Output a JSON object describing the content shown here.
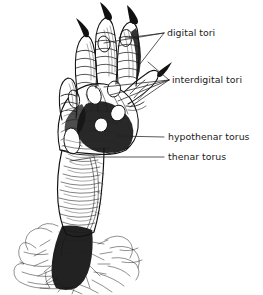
{
  "figure": {
    "background_color": "#ffffff",
    "ink_color": "#111111",
    "text_color": "#1a1a1a",
    "width": 263,
    "height": 295
  },
  "annotations": [
    {
      "id": "digital-tori",
      "label": "digital tori",
      "text_x": 167,
      "text_y": 36,
      "leader_count": 2,
      "pointer_origin": {
        "x": 164,
        "y": 33
      },
      "targets": [
        {
          "x": 104,
          "y": 43
        },
        {
          "x": 126,
          "y": 38
        }
      ]
    },
    {
      "id": "interdigital-tori",
      "label": "interdigital tori",
      "text_x": 172,
      "text_y": 83,
      "leader_count": 4,
      "pointer_origin": {
        "x": 169,
        "y": 80
      },
      "targets": [
        {
          "x": 104,
          "y": 87
        },
        {
          "x": 110,
          "y": 95
        },
        {
          "x": 118,
          "y": 101
        },
        {
          "x": 128,
          "y": 106
        }
      ]
    },
    {
      "id": "hypothenar-torus",
      "label": "hypothenar torus",
      "text_x": 168,
      "text_y": 140,
      "leader_count": 1,
      "pointer_origin": {
        "x": 164,
        "y": 137
      },
      "targets": [
        {
          "x": 116,
          "y": 137
        }
      ]
    },
    {
      "id": "thenar-torus",
      "label": "thenar torus",
      "text_x": 168,
      "text_y": 160,
      "leader_count": 1,
      "pointer_origin": {
        "x": 164,
        "y": 157
      },
      "targets": [
        {
          "x": 70,
          "y": 160
        }
      ]
    }
  ],
  "drawing_parts": [
    {
      "name": "digit-1-claw",
      "label": "claw of first digit"
    },
    {
      "name": "digit-2-claw",
      "label": "claw of second digit"
    },
    {
      "name": "digit-3-claw",
      "label": "claw of third digit"
    },
    {
      "name": "digit-4-toe",
      "label": "fourth digit"
    },
    {
      "name": "digit-5-toe",
      "label": "fifth digit"
    },
    {
      "name": "palm-sole",
      "label": "sole of foot"
    },
    {
      "name": "metatarsus",
      "label": "metatarsal shaft"
    },
    {
      "name": "ankle-fur",
      "label": "fur at ankle"
    }
  ]
}
